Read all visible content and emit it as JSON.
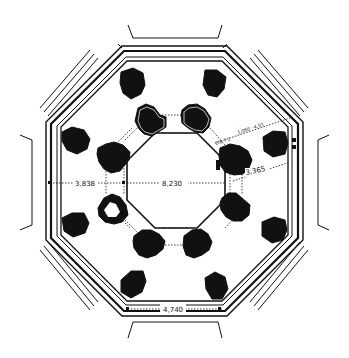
{
  "diagram": {
    "type": "architectural-floor-plan",
    "shape": "octagon",
    "colors": {
      "ink": "#111111",
      "background": "#ffffff"
    },
    "dimensions": {
      "left_ambulatory": "3,838",
      "center_span": "8,230",
      "right_ambulatory": "3,365",
      "diagonal_upper_right": "1,060 · 4,53",
      "diagonal_small": "0.6 7 2",
      "bottom_side": "4,740"
    },
    "elements": {
      "inner_piers_count": 8,
      "outer_piers_count": 8,
      "outer_walls": "octagonal multi-line walls with radiating wall stubs"
    }
  }
}
